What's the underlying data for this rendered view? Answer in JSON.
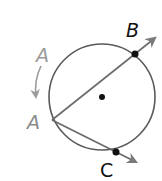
{
  "diagram": {
    "colors": {
      "stroke": "#5a5a5a",
      "point": "#111111",
      "label": "#111111",
      "label_faded": "#9a9a9a",
      "arrow": "#7a7a7a"
    },
    "labels": {
      "a_start": "A",
      "a_end": "A",
      "b": "B",
      "c": "C"
    },
    "elements": {
      "circle": {
        "cx": 102,
        "cy": 97,
        "r": 53
      },
      "center_point": {
        "x": 102,
        "y": 97
      },
      "vertex_a": {
        "x": 52,
        "y": 120
      },
      "point_b": {
        "x": 135,
        "y": 54
      },
      "point_c": {
        "x": 116,
        "y": 152
      },
      "ray_ab_tip": {
        "x": 157,
        "y": 36
      },
      "ray_ac_tip": {
        "x": 138,
        "y": 163
      }
    }
  }
}
